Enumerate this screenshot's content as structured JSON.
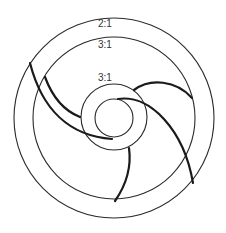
{
  "diagram": {
    "type": "impeller-cross-section",
    "colors": {
      "stroke": "#2a2a2a",
      "background": "#ffffff"
    },
    "rings": [
      {
        "name": "outer-ring",
        "cx": 114,
        "cy": 118,
        "r": 100
      },
      {
        "name": "second-ring",
        "cx": 114,
        "cy": 118,
        "r": 81
      },
      {
        "name": "middle-ring",
        "cx": 114,
        "cy": 117,
        "r": 33
      },
      {
        "name": "inner-ring",
        "cx": 114,
        "cy": 118,
        "r": 19
      }
    ],
    "labels": [
      {
        "name": "outer-ratio-label",
        "text": "2:1",
        "x": 98,
        "y": 27
      },
      {
        "name": "second-ratio-label",
        "text": "3:1",
        "x": 98,
        "y": 48
      },
      {
        "name": "middle-ratio-label",
        "text": "3:1",
        "x": 98,
        "y": 81
      }
    ],
    "blades": [
      {
        "name": "blade-1",
        "d": "M30,63 C42,110 70,136 112,139"
      },
      {
        "name": "blade-2",
        "d": "M45,77 C52,96 62,110 80,117"
      },
      {
        "name": "blade-3",
        "d": "M134,90 C150,78 176,80 192,98"
      },
      {
        "name": "blade-4",
        "d": "M118,99 C150,94 184,130 193,183"
      },
      {
        "name": "blade-5",
        "d": "M129,148 C132,170 124,188 115,201"
      }
    ]
  }
}
